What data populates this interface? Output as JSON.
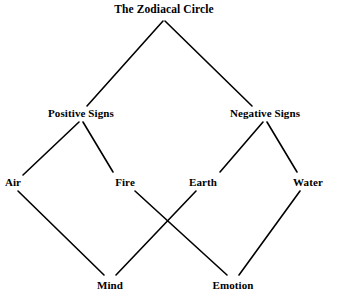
{
  "diagram": {
    "kind": "lattice-diagram",
    "title": "The Zodiacal Circle",
    "background_color": "#ffffff",
    "line_color": "#000000",
    "text_color": "#000000",
    "nodes": [
      {
        "id": "zodiacal-circle",
        "label": "The Zodiacal Circle",
        "level": 0,
        "x": 164,
        "y": 9
      },
      {
        "id": "positive-signs",
        "label": "Positive Signs",
        "level": 1,
        "x": 81,
        "y": 113
      },
      {
        "id": "negative-signs",
        "label": "Negative Signs",
        "level": 1,
        "x": 265,
        "y": 113
      },
      {
        "id": "air",
        "label": "Air",
        "level": 2,
        "x": 13,
        "y": 182
      },
      {
        "id": "fire",
        "label": "Fire",
        "level": 2,
        "x": 125,
        "y": 182
      },
      {
        "id": "earth",
        "label": "Earth",
        "level": 2,
        "x": 203,
        "y": 182
      },
      {
        "id": "water",
        "label": "Water",
        "level": 2,
        "x": 308,
        "y": 182
      },
      {
        "id": "mind",
        "label": "Mind",
        "level": 3,
        "x": 110,
        "y": 285
      },
      {
        "id": "emotion",
        "label": "Emotion",
        "level": 3,
        "x": 233,
        "y": 285
      }
    ],
    "edges": [
      {
        "id": "edge-zodiacal-positive",
        "from": "zodiacal-circle",
        "to": "positive-signs",
        "x1": 163,
        "y1": 21,
        "x2": 87,
        "y2": 106
      },
      {
        "id": "edge-zodiacal-negative",
        "from": "zodiacal-circle",
        "to": "negative-signs",
        "x1": 165,
        "y1": 21,
        "x2": 252,
        "y2": 106
      },
      {
        "id": "edge-positive-air",
        "from": "positive-signs",
        "to": "air",
        "x1": 79,
        "y1": 122,
        "x2": 23,
        "y2": 175
      },
      {
        "id": "edge-positive-fire",
        "from": "positive-signs",
        "to": "fire",
        "x1": 83,
        "y1": 122,
        "x2": 113,
        "y2": 172
      },
      {
        "id": "edge-negative-earth",
        "from": "negative-signs",
        "to": "earth",
        "x1": 263,
        "y1": 122,
        "x2": 220,
        "y2": 172
      },
      {
        "id": "edge-negative-water",
        "from": "negative-signs",
        "to": "water",
        "x1": 267,
        "y1": 122,
        "x2": 297,
        "y2": 172
      },
      {
        "id": "edge-air-mind",
        "from": "air",
        "to": "mind",
        "x1": 18,
        "y1": 191,
        "x2": 104,
        "y2": 275
      },
      {
        "id": "edge-fire-emotion",
        "from": "fire",
        "to": "emotion",
        "x1": 135,
        "y1": 191,
        "x2": 227,
        "y2": 275
      },
      {
        "id": "edge-earth-mind",
        "from": "earth",
        "to": "mind",
        "x1": 196,
        "y1": 191,
        "x2": 116,
        "y2": 275
      },
      {
        "id": "edge-water-emotion",
        "from": "water",
        "to": "emotion",
        "x1": 300,
        "y1": 191,
        "x2": 239,
        "y2": 275
      }
    ],
    "crossing_point": {
      "x": 168,
      "y": 219
    }
  }
}
